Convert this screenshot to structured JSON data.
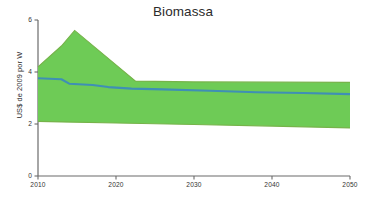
{
  "chart_data": {
    "type": "area",
    "title": "Biomassa",
    "xlabel": "",
    "ylabel": "US$ de 2009 por W",
    "xlim": [
      2010,
      2050
    ],
    "ylim": [
      0,
      6
    ],
    "xticks": [
      2010,
      2020,
      2030,
      2040,
      2050
    ],
    "xtick_labels": [
      "2010",
      "2020",
      "2030",
      "2040",
      "2050"
    ],
    "yticks": [
      0,
      2,
      4,
      6
    ],
    "ytick_labels": [
      "0",
      "2",
      "4",
      "6"
    ],
    "grid": false,
    "legend": null,
    "colors": {
      "band_fill": "#6ecb56",
      "band_stroke": "#76b34a",
      "line": "#3f8fb5",
      "axis": "#6b6b6b",
      "text": "#2b2b2b"
    },
    "series": [
      {
        "name": "Faixa de incerteza (superior)",
        "role": "band_upper",
        "x": [
          2010,
          2013,
          2014.7,
          2022.5,
          2030,
          2040,
          2050
        ],
        "values": [
          4.2,
          5.0,
          5.6,
          3.65,
          3.62,
          3.61,
          3.6
        ]
      },
      {
        "name": "Faixa de incerteza (inferior)",
        "role": "band_lower",
        "x": [
          2010,
          2013,
          2020,
          2030,
          2040,
          2050
        ],
        "values": [
          2.1,
          2.08,
          2.04,
          1.98,
          1.92,
          1.85
        ]
      },
      {
        "name": "Projecao central",
        "role": "line",
        "x": [
          2010,
          2013,
          2014,
          2017,
          2019,
          2022,
          2026,
          2032,
          2038,
          2044,
          2050
        ],
        "values": [
          3.76,
          3.72,
          3.55,
          3.5,
          3.42,
          3.36,
          3.33,
          3.28,
          3.22,
          3.19,
          3.15
        ]
      }
    ]
  }
}
